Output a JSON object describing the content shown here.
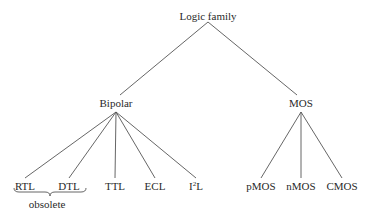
{
  "diagram": {
    "type": "tree",
    "line_color": "#555555",
    "text_color": "#2a2a2a",
    "root": {
      "label": "Logic family",
      "x": 208,
      "y": 10,
      "apex_y": 22
    },
    "branches": [
      {
        "label": "Bipolar",
        "x": 116,
        "y": 97,
        "apex_y": 112,
        "children": [
          {
            "label": "RTL",
            "x": 25
          },
          {
            "label": "DTL",
            "x": 69
          },
          {
            "label": "TTL",
            "x": 115
          },
          {
            "label": "ECL",
            "x": 155
          },
          {
            "label": "I",
            "sup": "2",
            "suffix": "L",
            "x": 196
          }
        ]
      },
      {
        "label": "MOS",
        "x": 301,
        "y": 97,
        "apex_y": 112,
        "children": [
          {
            "label": "pMOS",
            "x": 261
          },
          {
            "label": "nMOS",
            "x": 301
          },
          {
            "label": "CMOS",
            "x": 342
          }
        ]
      }
    ],
    "leaf_label_y": 180,
    "leaf_line_end_y": 178,
    "group_annotation": {
      "label": "obsolete",
      "covers": [
        "RTL",
        "DTL"
      ],
      "x": 47,
      "y": 198,
      "brace_x1": 14,
      "brace_x2": 86,
      "brace_y": 192
    }
  }
}
